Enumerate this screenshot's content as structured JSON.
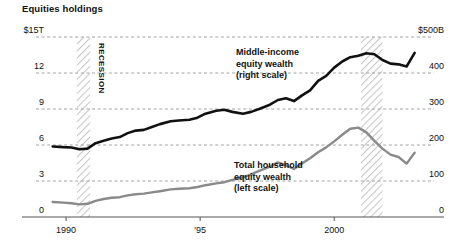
{
  "chart": {
    "title": "Equities holdings"
  },
  "annotations": {
    "middle_income": "Middle-income\nequity wealth\n(right scale)",
    "total_household": "Total household\nequity wealth\n(left scale)",
    "recession": "RECESSION"
  },
  "axes": {
    "left_ticks": [
      "$15T",
      "12",
      "9",
      "6",
      "3",
      "0"
    ],
    "right_ticks": [
      "$500B",
      "400",
      "300",
      "200",
      "100",
      "0"
    ],
    "x_ticks": [
      "1990",
      "'95",
      "2000"
    ]
  },
  "chart_data": {
    "type": "line",
    "title": "Equities holdings",
    "xlabel": "",
    "ylabel": "",
    "grid": true,
    "legend_position": "inline-annotations",
    "x_tick_labels": [
      "1990",
      "'95",
      "2000"
    ],
    "x_tick_values": [
      1990,
      1995,
      2000
    ],
    "xlim": [
      1989.4,
      2003.2
    ],
    "left_axis": {
      "label": "$15T",
      "unit": "trillions USD",
      "ylim": [
        0,
        15
      ],
      "tick_values": [
        0,
        3,
        6,
        9,
        12,
        15
      ],
      "tick_labels": [
        "0",
        "3",
        "6",
        "9",
        "12",
        "$15T"
      ]
    },
    "right_axis": {
      "label": "$500B",
      "unit": "billions USD",
      "ylim": [
        0,
        500
      ],
      "tick_values": [
        0,
        100,
        200,
        300,
        400,
        500
      ],
      "tick_labels": [
        "0",
        "100",
        "200",
        "300",
        "400",
        "$500B"
      ]
    },
    "shaded_regions": [
      {
        "label": "RECESSION",
        "x_start": 1990.4,
        "x_end": 1990.9,
        "style": "diagonal-hatch"
      },
      {
        "label": "",
        "x_start": 2001.0,
        "x_end": 2001.8,
        "style": "diagonal-hatch"
      }
    ],
    "series": [
      {
        "name": "Middle-income equity wealth (right scale)",
        "axis": "right",
        "color": "#111111",
        "width": 2.6,
        "x": [
          1989.5,
          1989.9,
          1990.2,
          1990.5,
          1990.8,
          1991.1,
          1991.4,
          1991.7,
          1992.0,
          1992.3,
          1992.6,
          1992.9,
          1993.2,
          1993.5,
          1993.9,
          1994.2,
          1994.6,
          1994.9,
          1995.2,
          1995.6,
          1995.9,
          1996.2,
          1996.6,
          1996.9,
          1997.2,
          1997.6,
          1997.9,
          1998.2,
          1998.5,
          1998.8,
          1999.1,
          1999.4,
          1999.7,
          2000.0,
          2000.3,
          2000.6,
          2000.9,
          2001.2,
          2001.5,
          2001.8,
          2002.1,
          2002.4,
          2002.7,
          2003.0
        ],
        "values": [
          196,
          194,
          193,
          188,
          190,
          205,
          212,
          218,
          222,
          233,
          240,
          242,
          250,
          258,
          266,
          268,
          270,
          276,
          287,
          295,
          298,
          292,
          287,
          292,
          300,
          312,
          325,
          330,
          322,
          338,
          352,
          378,
          392,
          415,
          432,
          444,
          448,
          455,
          452,
          436,
          426,
          424,
          418,
          456
        ]
      },
      {
        "name": "Total household equity wealth (left scale)",
        "axis": "left",
        "color": "#8a8a8a",
        "width": 2.4,
        "x": [
          1989.5,
          1989.9,
          1990.2,
          1990.5,
          1990.8,
          1991.1,
          1991.4,
          1991.7,
          1992.0,
          1992.3,
          1992.6,
          1992.9,
          1993.2,
          1993.5,
          1993.9,
          1994.2,
          1994.6,
          1994.9,
          1995.2,
          1995.6,
          1995.9,
          1996.2,
          1996.6,
          1996.9,
          1997.2,
          1997.6,
          1997.9,
          1998.2,
          1998.5,
          1998.8,
          1999.1,
          1999.4,
          1999.7,
          2000.0,
          2000.3,
          2000.6,
          2000.9,
          2001.2,
          2001.5,
          2001.8,
          2002.1,
          2002.4,
          2002.7,
          2003.0
        ],
        "values": [
          1.25,
          1.2,
          1.15,
          1.05,
          1.1,
          1.35,
          1.5,
          1.6,
          1.65,
          1.8,
          1.9,
          1.95,
          2.05,
          2.15,
          2.3,
          2.35,
          2.4,
          2.5,
          2.65,
          2.8,
          2.9,
          3.1,
          3.3,
          3.55,
          3.85,
          4.2,
          4.55,
          4.3,
          4.0,
          4.45,
          4.9,
          5.4,
          5.8,
          6.3,
          6.85,
          7.35,
          7.45,
          7.05,
          6.35,
          5.7,
          5.2,
          5.0,
          4.45,
          5.35
        ]
      }
    ]
  }
}
